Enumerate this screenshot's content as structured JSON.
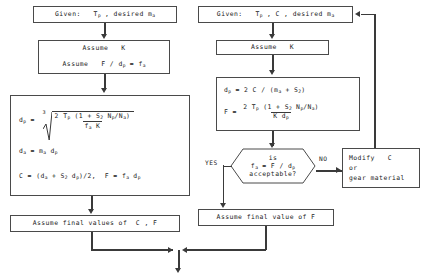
{
  "diagram": {
    "type": "flowchart",
    "line_color": "#3a3a3a",
    "background": "#ffffff"
  },
  "left_branch": {
    "given": {
      "label": "Given:   T",
      "sub1": "p",
      "label2": " , desired m",
      "sub2": "a"
    },
    "assume": {
      "line1": "Assume   K",
      "line2_a": "Assume   F / d",
      "line2_sub": "p",
      "line2_b": " = f",
      "line2_sub2": "a"
    },
    "formula": {
      "dp_lhs": "d",
      "dp_lhs_sub": "p",
      "dp_eq": " = ",
      "root_index": "3",
      "numerator": "2 T",
      "numerator_sub": "p",
      "numerator_rest": " (1 + S",
      "numerator_sub2": "2",
      "numerator_rest2": " N",
      "numerator_sub3": "p",
      "numerator_rest3": "/N",
      "numerator_sub4": "a",
      "numerator_rest4": ")",
      "denominator": "f",
      "denominator_sub": "a",
      "denominator_rest": " K",
      "line2": "d",
      "line2_sub": "a",
      "line2_b": " = m",
      "line2_sub2": "a",
      "line2_c": " d",
      "line2_sub3": "p",
      "line3": "C = (d",
      "line3_sub": "a",
      "line3_b": " + S",
      "line3_sub2": "2",
      "line3_c": " d",
      "line3_sub3": "p",
      "line3_d": ")/2,  F = f",
      "line3_sub4": "a",
      "line3_e": " d",
      "line3_sub5": "p"
    },
    "final": {
      "label": "Assume final values of  C , F"
    }
  },
  "right_branch": {
    "given": {
      "label": "Given:   T",
      "sub1": "p",
      "label2": " , C , desired m",
      "sub2": "a"
    },
    "assume": {
      "line1": "Assume   K"
    },
    "formula": {
      "line1": "d",
      "line1_sub": "p",
      "line1_b": " = 2 C / (m",
      "line1_sub2": "a",
      "line1_c": " + S",
      "line1_sub3": "2",
      "line1_d": ")",
      "f_lhs": "F = ",
      "numerator": "2 T",
      "numerator_sub": "p",
      "numerator_rest": " (1 + S",
      "numerator_sub2": "2",
      "numerator_rest2": " N",
      "numerator_sub3": "p",
      "numerator_rest3": "/N",
      "numerator_sub4": "a",
      "numerator_rest4": ")",
      "denominator": "K d",
      "denominator_sub": "p"
    },
    "decision": {
      "line1": "is",
      "line2_a": "f",
      "line2_sub": "a",
      "line2_b": " = F / d",
      "line2_sub2": "p",
      "line3": "acceptable?"
    },
    "yes_label": "YES",
    "no_label": "NO",
    "modify": {
      "line1": "Modify   C",
      "line2": "or",
      "line3": "gear material"
    },
    "final": {
      "label": "Assume final value of F"
    }
  }
}
